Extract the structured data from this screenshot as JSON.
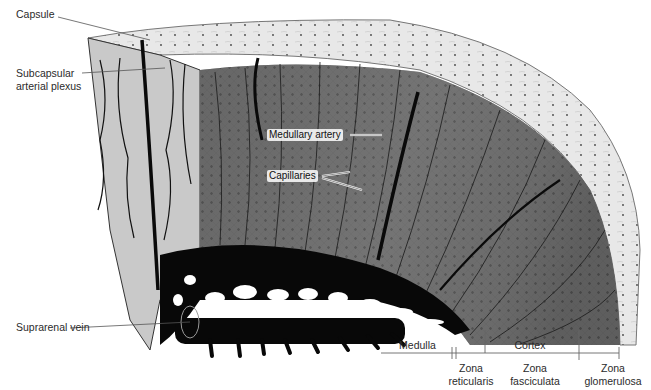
{
  "figure": {
    "colors": {
      "capsule": "#e6e6e6",
      "cortex_dark": "#5c5c5c",
      "cortex_mid": "#8a8a8a",
      "medulla_vessels": "#0b0b0b",
      "left_face": "#c9c9c9",
      "label_line": "#555555"
    }
  },
  "labels": {
    "capsule": "Capsule",
    "subcapsular_line1": "Subcapsular",
    "subcapsular_line2": "arterial plexus",
    "medullary_artery": "Medullary artery",
    "capillaries": "Capillaries",
    "suprarenal_vein": "Suprarenal vein"
  },
  "scale": {
    "medulla": "Medulla",
    "cortex": "Cortex",
    "zona_reticularis_line1": "Zona",
    "zona_reticularis_line2": "reticularis",
    "zona_fasciculata_line1": "Zona",
    "zona_fasciculata_line2": "fasciculata",
    "zona_glomerulosa_line1": "Zona",
    "zona_glomerulosa_line2": "glomerulosa"
  }
}
